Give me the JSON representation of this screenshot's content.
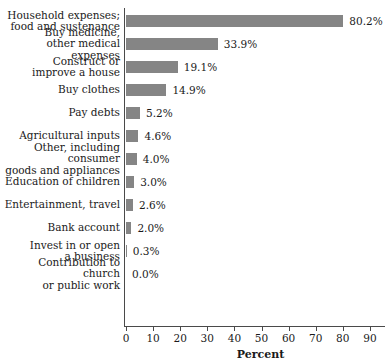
{
  "chart_data": {
    "type": "bar",
    "orientation": "horizontal",
    "title": "",
    "xlabel": "Percent",
    "ylabel": "",
    "xlim": [
      0,
      96
    ],
    "grid": false,
    "legend": false,
    "bar_color": "#858585",
    "axis_color": "#4a4a4a",
    "xticks": [
      0,
      10,
      20,
      30,
      40,
      50,
      60,
      70,
      80,
      90
    ],
    "xtick_labels": [
      "0",
      "10",
      "20",
      "30",
      "40",
      "50",
      "60",
      "70",
      "80",
      "90"
    ],
    "categories": [
      "Household expenses;\nfood and sustenance",
      "Buy medicine,\nother medical expenses",
      "Construct or\nimprove a house",
      "Buy clothes",
      "Pay debts",
      "Agricultural inputs",
      "Other, including consumer\ngoods and appliances",
      "Education of children",
      "Entertainment, travel",
      "Bank account",
      "Invest in or open\na business",
      "Contribution to church\nor public work"
    ],
    "values": [
      80.2,
      33.9,
      19.1,
      14.9,
      5.2,
      4.6,
      4.0,
      3.0,
      2.6,
      2.0,
      0.3,
      0.0
    ],
    "value_labels": [
      "80.2%",
      "33.9%",
      "19.1%",
      "14.9%",
      "5.2%",
      "4.6%",
      "4.0%",
      "3.0%",
      "2.6%",
      "2.0%",
      "0.3%",
      "0.0%"
    ]
  },
  "title_sliver": ""
}
